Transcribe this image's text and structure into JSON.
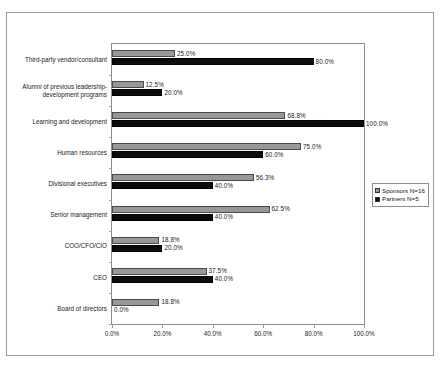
{
  "chart_data": {
    "type": "bar",
    "orientation": "horizontal",
    "title": "",
    "xlabel": "",
    "ylabel": "",
    "xlim": [
      0,
      100
    ],
    "xticks": [
      "0.0%",
      "20.0%",
      "40.0%",
      "60.0%",
      "80.0%",
      "100.0%"
    ],
    "xtick_values": [
      0,
      20,
      40,
      60,
      80,
      100
    ],
    "grid": false,
    "legend_position": "right-middle",
    "categories": [
      "Third-party vendor/consultant",
      "Alumni of previous leadership-\ndevelopment programs",
      "Learning and development",
      "Human resources",
      "Divisional executives",
      "Senior management",
      "COO/CFO/CIO",
      "CEO",
      "Board of directors"
    ],
    "series": [
      {
        "name": "Sponsors N=16",
        "color": "#989898",
        "values": [
          25.0,
          12.5,
          68.8,
          75.0,
          56.3,
          62.5,
          18.8,
          37.5,
          18.8
        ],
        "labels": [
          "25.0%",
          "12.5%",
          "68.8%",
          "75.0%",
          "56.3%",
          "62.5%",
          "18.8%",
          "37.5%",
          "18.8%"
        ]
      },
      {
        "name": "Partners N=5",
        "color": "#0b0b0b",
        "values": [
          80.0,
          20.0,
          100.0,
          60.0,
          40.0,
          40.0,
          20.0,
          40.0,
          0.0
        ],
        "labels": [
          "80.0%",
          "20.0%",
          "100.0%",
          "60.0%",
          "40.0%",
          "40.0%",
          "20.0%",
          "40.0%",
          "0.0%"
        ]
      }
    ]
  },
  "legend": {
    "items": [
      {
        "label": "Sponsors N=16",
        "color": "#989898"
      },
      {
        "label": "Partners N=5",
        "color": "#0b0b0b"
      }
    ]
  }
}
